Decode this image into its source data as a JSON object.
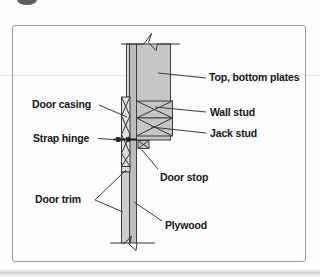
{
  "diagram": {
    "labels": {
      "top_bottom_plates": "Top, bottom plates",
      "wall_stud": "Wall stud",
      "jack_stud": "Jack stud",
      "door_casing": "Door casing",
      "strap_hinge": "Strap hinge",
      "door_stop": "Door stop",
      "door_trim": "Door trim",
      "plywood": "Plywood"
    }
  },
  "colors": {
    "lumber_fill": "#c6c6c6",
    "plywood_fill": "#bdbdbd",
    "casing_fill": "#dedede",
    "trim_fill": "#cdcdcd",
    "edge_strip_fill": "#d7d7d7",
    "line": "#333333",
    "label_text": "#151515",
    "frame_border": "#9b9b9b"
  }
}
